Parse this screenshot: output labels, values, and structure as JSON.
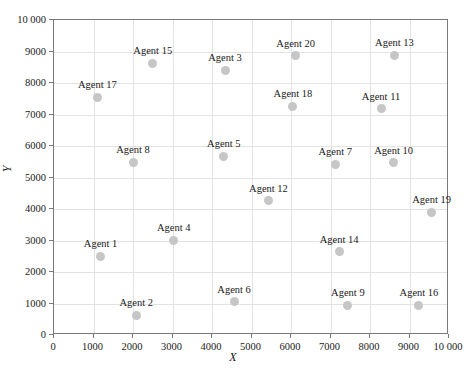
{
  "chart_data": {
    "type": "scatter",
    "title": "",
    "xlabel": "X",
    "ylabel": "Y",
    "xlim": [
      0,
      10000
    ],
    "ylim": [
      0,
      10000
    ],
    "grid": true,
    "legend": false,
    "marker_color": "#c6c6c6",
    "axis_color": "#7a7a7a",
    "grid_color": "#e3e3e3",
    "xticks": [
      0,
      1000,
      2000,
      3000,
      4000,
      5000,
      6000,
      7000,
      8000,
      9000,
      10000
    ],
    "xticklabels": [
      "0",
      "1000",
      "2000",
      "3000",
      "4000",
      "5000",
      "6000",
      "7000",
      "8000",
      "9000",
      "10 000"
    ],
    "yticks": [
      0,
      1000,
      2000,
      3000,
      4000,
      5000,
      6000,
      7000,
      8000,
      9000,
      10000
    ],
    "yticklabels": [
      "0",
      "1000",
      "2000",
      "3000",
      "4000",
      "5000",
      "6000",
      "7000",
      "8000",
      "9000",
      "10 000"
    ],
    "points": [
      {
        "label": "Agent 1",
        "x": 1180,
        "y": 2500
      },
      {
        "label": "Agent 2",
        "x": 2080,
        "y": 620
      },
      {
        "label": "Agent 3",
        "x": 4330,
        "y": 8400
      },
      {
        "label": "Agent 4",
        "x": 3030,
        "y": 3010
      },
      {
        "label": "Agent 5",
        "x": 4300,
        "y": 5680
      },
      {
        "label": "Agent 6",
        "x": 4560,
        "y": 1060
      },
      {
        "label": "Agent 7",
        "x": 7120,
        "y": 5420
      },
      {
        "label": "Agent 8",
        "x": 2000,
        "y": 5480
      },
      {
        "label": "Agent 9",
        "x": 7440,
        "y": 950
      },
      {
        "label": "Agent 10",
        "x": 8600,
        "y": 5470
      },
      {
        "label": "Agent 11",
        "x": 8280,
        "y": 7180
      },
      {
        "label": "Agent 12",
        "x": 5430,
        "y": 4260
      },
      {
        "label": "Agent 13",
        "x": 8620,
        "y": 8880
      },
      {
        "label": "Agent 14",
        "x": 7220,
        "y": 2640
      },
      {
        "label": "Agent 15",
        "x": 2500,
        "y": 8620
      },
      {
        "label": "Agent 16",
        "x": 9240,
        "y": 950
      },
      {
        "label": "Agent 17",
        "x": 1100,
        "y": 7540
      },
      {
        "label": "Agent 18",
        "x": 6050,
        "y": 7260
      },
      {
        "label": "Agent 19",
        "x": 9560,
        "y": 3900
      },
      {
        "label": "Agent 20",
        "x": 6120,
        "y": 8860
      }
    ]
  }
}
